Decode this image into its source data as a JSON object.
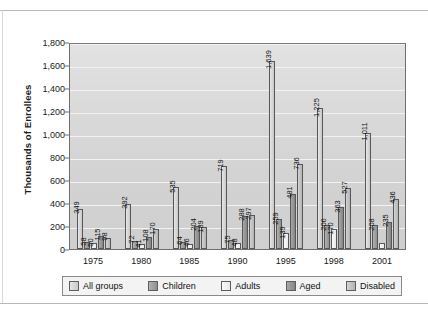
{
  "chart_data": {
    "type": "bar",
    "title": "",
    "xlabel": "",
    "ylabel": "Thousands of Enrollees",
    "categories": [
      "1975",
      "1980",
      "1985",
      "1990",
      "1995",
      "1998",
      "2001"
    ],
    "series": [
      {
        "name": "All groups",
        "values": [
          349,
          392,
          535,
          719,
          1639,
          1225,
          1011
        ],
        "labels": [
          "349",
          "392",
          "535",
          "719",
          "1,639",
          "1,225",
          "1,011"
        ],
        "color": "#d8d8d8"
      },
      {
        "name": "Children",
        "values": [
          58,
          72,
          64,
          75,
          259,
          206,
          208
        ],
        "labels": [
          "58",
          "72",
          "64",
          "75",
          "259",
          "206",
          "208"
        ],
        "color": "#9e9e9e"
      },
      {
        "name": "Adults",
        "values": [
          50,
          41,
          46,
          48,
          139,
          170,
          55
        ],
        "labels": [
          "50",
          "41",
          "46",
          "48",
          "139",
          "170",
          ""
        ],
        "color": "#f2f2f2"
      },
      {
        "name": "Aged",
        "values": [
          115,
          108,
          204,
          288,
          481,
          363,
          235
        ],
        "labels": [
          "115",
          "108",
          "204",
          "288",
          "481",
          "363",
          "235"
        ],
        "color": "#949494"
      },
      {
        "name": "Disabled",
        "values": [
          98,
          170,
          189,
          297,
          736,
          527,
          436
        ],
        "labels": [
          "98",
          "170",
          "189",
          "297",
          "736",
          "527",
          "436"
        ],
        "color": "#c3c3c3"
      }
    ],
    "ylim": [
      0,
      1800
    ],
    "yticks": [
      0,
      200,
      400,
      600,
      800,
      1000,
      1200,
      1400,
      1600,
      1800
    ],
    "ytick_labels": [
      "0",
      "200",
      "400",
      "600",
      "800",
      "1,000",
      "1,200",
      "1,400",
      "1,600",
      "1,800"
    ],
    "grid": true,
    "legend_position": "bottom"
  },
  "legend": {
    "items": [
      {
        "label": "All groups"
      },
      {
        "label": "Children"
      },
      {
        "label": "Adults"
      },
      {
        "label": "Aged"
      },
      {
        "label": "Disabled"
      }
    ]
  }
}
